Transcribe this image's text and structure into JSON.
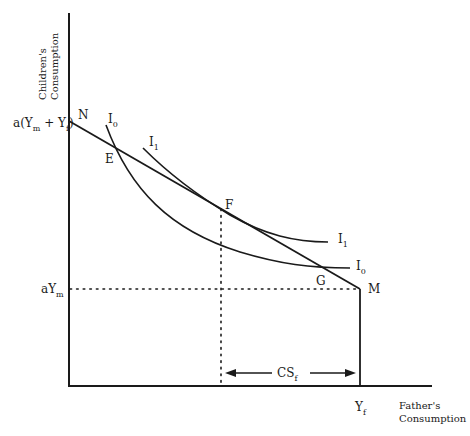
{
  "diagram": {
    "axes": {
      "y_title_line1": "Children's",
      "y_title_line2": "Consumption",
      "x_title_line1": "Father's",
      "x_title_line2": "Consumption"
    },
    "y_ticks": {
      "top": {
        "main": "a(Y",
        "sub1": "m",
        "plus": " + Y",
        "sub2": "f",
        "close": ")"
      },
      "mid": {
        "main": "aY",
        "sub": "m"
      }
    },
    "x_ticks": {
      "yf": {
        "main": "Y",
        "sub": "f"
      }
    },
    "points": {
      "N": "N",
      "E": "E",
      "F": "F",
      "G": "G",
      "M": "M"
    },
    "curves": {
      "I0_top": {
        "main": "I",
        "sub": "0"
      },
      "I1_top": {
        "main": "I",
        "sub": "1"
      },
      "I1_right": {
        "main": "I",
        "sub": "1"
      },
      "I0_right": {
        "main": "I",
        "sub": "0"
      }
    },
    "annotation": {
      "cs": {
        "main": "CS",
        "sub": "f"
      }
    }
  }
}
